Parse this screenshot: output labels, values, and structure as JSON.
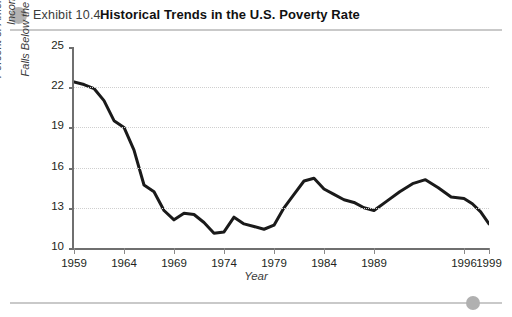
{
  "header": {
    "exhibit_label": "Exhibit 10.4",
    "title": "Historical Trends in the U.S. Poverty Rate",
    "bullet_color": "#b3b3b3",
    "rule_color": "#c9c9c9"
  },
  "footer": {
    "dot_color": "#b0b0b0",
    "rule_color": "#c9c9c9"
  },
  "chart_data": {
    "type": "line",
    "title": "Historical Trends in the U.S. Poverty Rate",
    "subtitle": "Exhibit 10.4",
    "xlabel": "Year",
    "ylabel_line1": "Percent of Americans Whose Income",
    "ylabel_line2": "Falls Below the Poverty Line",
    "ylabel": "Percent of Americans Whose Income Falls Below the Poverty Line",
    "ylim": [
      10,
      25
    ],
    "yticks": [
      10,
      13,
      16,
      19,
      22,
      25
    ],
    "ytick_labels": [
      "10",
      "13",
      "16",
      "19",
      "22",
      "25"
    ],
    "gridlines": [
      13,
      16,
      19,
      22
    ],
    "grid": true,
    "grid_style": "dotted",
    "legend": "none",
    "xlim": [
      1959,
      1999
    ],
    "xticks": [
      1959,
      1964,
      1969,
      1974,
      1979,
      1984,
      1989,
      1996,
      1999
    ],
    "xtick_labels": [
      "1959",
      "1964",
      "1969",
      "1974",
      "1979",
      "1984",
      "1989",
      "1996",
      "1999"
    ],
    "line_color": "#1a1a1a",
    "line_width": 3,
    "x": [
      1959,
      1960,
      1961,
      1962,
      1963,
      1964,
      1965,
      1966,
      1967,
      1968,
      1969,
      1970,
      1971,
      1972,
      1973,
      1974,
      1975,
      1976,
      1977,
      1978,
      1979,
      1980,
      1981,
      1982,
      1983,
      1984,
      1985,
      1986,
      1987,
      1988,
      1989,
      1990,
      1991,
      1992,
      1993,
      1994,
      1995,
      1996,
      1997,
      1998,
      1999
    ],
    "values": [
      22.4,
      22.2,
      21.9,
      21.0,
      19.5,
      19.0,
      17.3,
      14.7,
      14.2,
      12.8,
      12.1,
      12.6,
      12.5,
      11.9,
      11.1,
      11.2,
      12.3,
      11.8,
      11.6,
      11.4,
      11.7,
      13.0,
      14.0,
      15.0,
      15.2,
      14.4,
      14.0,
      13.6,
      13.4,
      13.0,
      12.8,
      13.5,
      14.2,
      14.8,
      15.1,
      14.5,
      13.8,
      13.7,
      13.3,
      12.7,
      11.8
    ],
    "series": [
      {
        "name": "U.S. Poverty Rate",
        "values": [
          22.4,
          22.2,
          21.9,
          21.0,
          19.5,
          19.0,
          17.3,
          14.7,
          14.2,
          12.8,
          12.1,
          12.6,
          12.5,
          11.9,
          11.1,
          11.2,
          12.3,
          11.8,
          11.6,
          11.4,
          11.7,
          13.0,
          14.0,
          15.0,
          15.2,
          14.4,
          14.0,
          13.6,
          13.4,
          13.0,
          12.8,
          13.5,
          14.2,
          14.8,
          15.1,
          14.5,
          13.8,
          13.7,
          13.3,
          12.7,
          11.8
        ]
      }
    ]
  }
}
